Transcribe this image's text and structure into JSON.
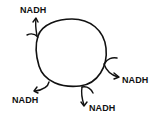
{
  "diagram": {
    "cycle": {
      "shape": "circle",
      "stroke_color": "#111111"
    },
    "outputs": [
      {
        "label": "NADH",
        "position": "top-left"
      },
      {
        "label": "NADH",
        "position": "right"
      },
      {
        "label": "NADH",
        "position": "bottom-left"
      },
      {
        "label": "NADH",
        "position": "bottom"
      }
    ]
  }
}
